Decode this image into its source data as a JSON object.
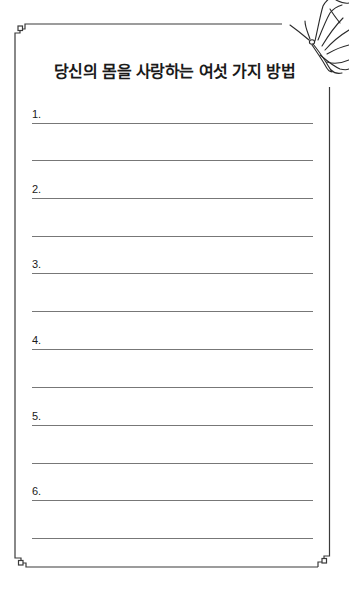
{
  "worksheet": {
    "title": "당신의 몸을 사랑하는 여섯 가지 방법",
    "items": [
      {
        "number": "1."
      },
      {
        "number": "2."
      },
      {
        "number": "3."
      },
      {
        "number": "4."
      },
      {
        "number": "5."
      },
      {
        "number": "6."
      }
    ],
    "decoration": {
      "corner_icon": "square-knot-ornament",
      "top_right_icon": "butterfly-icon"
    },
    "colors": {
      "border": "#333333",
      "rule_line": "#777777",
      "text": "#1a1a1a"
    }
  }
}
